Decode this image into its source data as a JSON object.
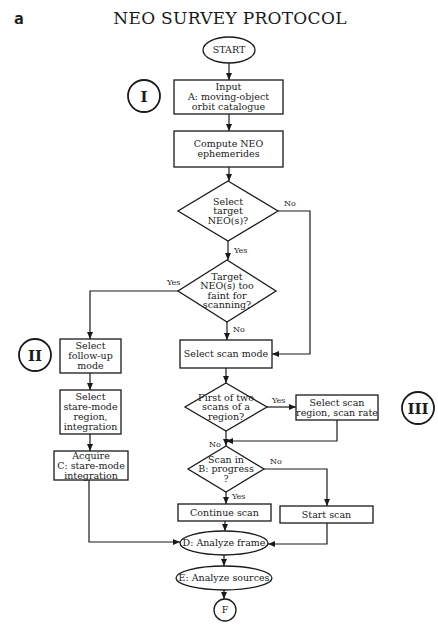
{
  "panel_label": "a",
  "title": "NEO SURVEY PROTOCOL",
  "colors": {
    "stroke": "#1a1a1a",
    "fill": "#ffffff",
    "background": "#ffffff"
  },
  "section_markers": [
    {
      "id": "I",
      "label": "I",
      "cx": 144,
      "cy": 96,
      "r": 16
    },
    {
      "id": "II",
      "label": "II",
      "cx": 35,
      "cy": 355,
      "r": 16
    },
    {
      "id": "III",
      "label": "III",
      "cx": 418,
      "cy": 408,
      "r": 16
    }
  ],
  "nodes": [
    {
      "id": "start",
      "type": "ellipse",
      "cx": 229,
      "cy": 50,
      "rx": 26,
      "ry": 13,
      "lines": [
        "START"
      ]
    },
    {
      "id": "input",
      "type": "rect",
      "x": 174,
      "y": 80,
      "w": 109,
      "h": 34,
      "lines": [
        "Input",
        "A:  moving-object",
        "orbit catalogue"
      ]
    },
    {
      "id": "compute",
      "type": "rect",
      "x": 174,
      "y": 131,
      "w": 109,
      "h": 36,
      "lines": [
        "Compute NEO",
        "ephemerides"
      ]
    },
    {
      "id": "select-target",
      "type": "diamond",
      "cx": 228,
      "cy": 211,
      "hw": 50,
      "hh": 30,
      "lines": [
        "Select",
        "target",
        "NEO(s)?"
      ]
    },
    {
      "id": "too-faint",
      "type": "diamond",
      "cx": 227,
      "cy": 291,
      "hw": 49,
      "hh": 31,
      "lines": [
        "Target",
        "NEO(s) too",
        "faint for",
        "scanning?"
      ]
    },
    {
      "id": "follow-up",
      "type": "rect",
      "x": 60,
      "y": 339,
      "w": 61,
      "h": 34,
      "lines": [
        "Select",
        "follow-up",
        "mode"
      ]
    },
    {
      "id": "stare-region",
      "type": "rect",
      "x": 60,
      "y": 390,
      "w": 61,
      "h": 44,
      "lines": [
        "Select",
        "stare-mode",
        "region,",
        "integration"
      ]
    },
    {
      "id": "acquire",
      "type": "rect",
      "x": 54,
      "y": 451,
      "w": 74,
      "h": 29,
      "lines": [
        "Acquire",
        "C:  stare-mode",
        "integration"
      ]
    },
    {
      "id": "scan-mode",
      "type": "rect",
      "x": 180,
      "y": 340,
      "w": 92,
      "h": 28,
      "lines": [
        "Select scan mode"
      ]
    },
    {
      "id": "first-scan",
      "type": "diamond",
      "cx": 226,
      "cy": 407,
      "hw": 41,
      "hh": 24,
      "lines": [
        "First of two",
        "scans of a",
        "region?"
      ]
    },
    {
      "id": "scan-region",
      "type": "rect",
      "x": 296,
      "y": 395,
      "w": 82,
      "h": 25,
      "lines": [
        "Select scan",
        "region, scan rate"
      ]
    },
    {
      "id": "in-progress",
      "type": "diamond",
      "cx": 226,
      "cy": 469,
      "hw": 38,
      "hh": 23,
      "lines": [
        "Scan in",
        "B:  progress",
        "?"
      ]
    },
    {
      "id": "continue",
      "type": "rect",
      "x": 178,
      "y": 504,
      "w": 93,
      "h": 17,
      "lines": [
        "Continue scan"
      ]
    },
    {
      "id": "start-scan",
      "type": "rect",
      "x": 280,
      "y": 506,
      "w": 93,
      "h": 17,
      "lines": [
        "Start scan"
      ]
    },
    {
      "id": "analyze-frame",
      "type": "ellipse",
      "cx": 224,
      "cy": 543,
      "rx": 44,
      "ry": 12,
      "lines": [
        "D: Analyze frame"
      ]
    },
    {
      "id": "analyze-sources",
      "type": "ellipse",
      "cx": 224,
      "cy": 578,
      "rx": 48,
      "ry": 12,
      "lines": [
        "E: Analyze sources"
      ]
    },
    {
      "id": "connector-f",
      "type": "circle",
      "cx": 225,
      "cy": 610,
      "r": 11,
      "lines": [
        "F"
      ]
    }
  ],
  "edges": [
    {
      "from": "start",
      "to": "input",
      "points": [
        [
          229,
          63
        ],
        [
          229,
          80
        ]
      ]
    },
    {
      "from": "input",
      "to": "compute",
      "points": [
        [
          229,
          114
        ],
        [
          229,
          131
        ]
      ]
    },
    {
      "from": "compute",
      "to": "select-target",
      "points": [
        [
          229,
          167
        ],
        [
          229,
          181
        ]
      ]
    },
    {
      "from": "select-target",
      "to": "too-faint",
      "label": "Yes",
      "label_x": 234,
      "label_y": 253,
      "points": [
        [
          228,
          241
        ],
        [
          228,
          260
        ]
      ]
    },
    {
      "from": "select-target",
      "to": "scan-mode",
      "label": "No",
      "label_x": 284,
      "label_y": 206,
      "points": [
        [
          278,
          211
        ],
        [
          310,
          211
        ],
        [
          310,
          354
        ],
        [
          272,
          354
        ]
      ]
    },
    {
      "from": "too-faint",
      "to": "follow-up",
      "label": "Yes",
      "label_x": 167,
      "label_y": 285,
      "points": [
        [
          178,
          291
        ],
        [
          90,
          291
        ],
        [
          90,
          339
        ]
      ]
    },
    {
      "from": "too-faint",
      "to": "scan-mode",
      "label": "No",
      "label_x": 233,
      "label_y": 332,
      "points": [
        [
          227,
          322
        ],
        [
          227,
          340
        ]
      ]
    },
    {
      "from": "follow-up",
      "to": "stare-region",
      "points": [
        [
          90,
          373
        ],
        [
          90,
          390
        ]
      ]
    },
    {
      "from": "stare-region",
      "to": "acquire",
      "points": [
        [
          90,
          434
        ],
        [
          90,
          451
        ]
      ]
    },
    {
      "from": "scan-mode",
      "to": "first-scan",
      "points": [
        [
          226,
          368
        ],
        [
          226,
          383
        ]
      ]
    },
    {
      "from": "first-scan",
      "to": "scan-region",
      "label": "Yes",
      "label_x": 272,
      "label_y": 403,
      "points": [
        [
          267,
          407
        ],
        [
          296,
          407
        ]
      ]
    },
    {
      "from": "scan-region",
      "to": "in-progress",
      "points": [
        [
          337,
          420
        ],
        [
          337,
          441
        ],
        [
          226,
          441
        ]
      ]
    },
    {
      "from": "first-scan",
      "to": "in-progress",
      "label": "No",
      "label_x": 209,
      "label_y": 447,
      "points": [
        [
          226,
          431
        ],
        [
          226,
          446
        ]
      ]
    },
    {
      "from": "in-progress",
      "to": "continue",
      "label": "Yes",
      "label_x": 232,
      "label_y": 499,
      "points": [
        [
          226,
          492
        ],
        [
          226,
          504
        ]
      ]
    },
    {
      "from": "in-progress",
      "to": "start-scan",
      "label": "No",
      "label_x": 270,
      "label_y": 464,
      "points": [
        [
          264,
          469
        ],
        [
          327,
          469
        ],
        [
          327,
          506
        ]
      ]
    },
    {
      "from": "acquire",
      "to": "analyze-frame",
      "points": [
        [
          89,
          480
        ],
        [
          89,
          542
        ],
        [
          180,
          542
        ]
      ]
    },
    {
      "from": "continue",
      "to": "analyze-frame",
      "points": [
        [
          225,
          521
        ],
        [
          225,
          531
        ]
      ]
    },
    {
      "from": "start-scan",
      "to": "analyze-frame",
      "points": [
        [
          327,
          523
        ],
        [
          327,
          544
        ],
        [
          268,
          544
        ]
      ]
    },
    {
      "from": "analyze-frame",
      "to": "analyze-sources",
      "points": [
        [
          224,
          555
        ],
        [
          224,
          566
        ]
      ]
    },
    {
      "from": "analyze-sources",
      "to": "connector-f",
      "points": [
        [
          224,
          590
        ],
        [
          224,
          599
        ]
      ]
    }
  ]
}
